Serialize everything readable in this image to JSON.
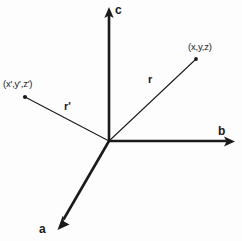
{
  "figure": {
    "type": "vector-diagram",
    "background_color": "#fdfdfd",
    "stroke_color": "#1a1a1a",
    "origin": {
      "x": 109,
      "y": 141
    },
    "axes": [
      {
        "id": "a",
        "label": "a",
        "label_x": 39,
        "label_y": 223,
        "tip": {
          "x": 58,
          "y": 229
        },
        "stroke_width": 2.6,
        "arrow": true
      },
      {
        "id": "b",
        "label": "b",
        "label_x": 218,
        "label_y": 125,
        "tip": {
          "x": 234,
          "y": 141
        },
        "stroke_width": 2.6,
        "arrow": true
      },
      {
        "id": "c",
        "label": "c",
        "label_x": 115,
        "label_y": 4,
        "tip": {
          "x": 109,
          "y": 8
        },
        "stroke_width": 2.6,
        "arrow": true
      }
    ],
    "vectors": [
      {
        "id": "r",
        "label": "r",
        "label_x": 148,
        "label_y": 74,
        "endpoint": {
          "x": 196,
          "y": 59
        },
        "endpoint_label": "(x,y,z)",
        "endpoint_label_x": 188,
        "endpoint_label_y": 42,
        "stroke_width": 1,
        "dot": true
      },
      {
        "id": "r-prime",
        "label": "r'",
        "label_x": 64,
        "label_y": 101,
        "endpoint": {
          "x": 25,
          "y": 97
        },
        "endpoint_label": "(x',y',z')",
        "endpoint_label_x": 3,
        "endpoint_label_y": 79,
        "stroke_width": 1,
        "dot": true
      }
    ]
  }
}
